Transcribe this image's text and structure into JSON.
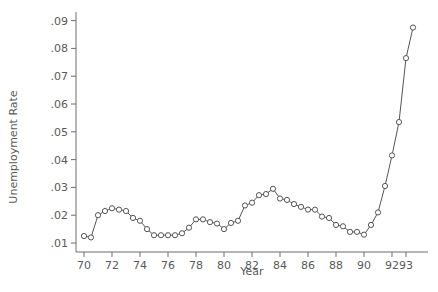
{
  "chart_data": {
    "type": "line",
    "title": "",
    "xlabel": "Year",
    "ylabel": "Unemployment Rate",
    "xlim": [
      69.2,
      94.5
    ],
    "ylim": [
      0.0,
      0.093
    ],
    "grid": false,
    "legend": null,
    "x_ticks": [
      70,
      72,
      74,
      76,
      78,
      80,
      82,
      84,
      86,
      88,
      90,
      92,
      93
    ],
    "x_tick_labels": [
      "70",
      "72",
      "74",
      "76",
      "78",
      "80",
      "82",
      "84",
      "86",
      "88",
      "90",
      "92",
      "93"
    ],
    "y_ticks": [
      0.01,
      0.02,
      0.03,
      0.04,
      0.05,
      0.06,
      0.07,
      0.08,
      0.09
    ],
    "y_tick_labels": [
      ".01",
      ".02",
      ".03",
      ".04",
      ".05",
      ".06",
      ".07",
      ".08",
      ".09"
    ],
    "marker": "open-circle",
    "series": [
      {
        "name": "Unemployment Rate",
        "x": [
          70.0,
          70.5,
          71.0,
          71.5,
          72.0,
          72.5,
          73.0,
          73.5,
          74.0,
          74.5,
          75.0,
          75.5,
          76.0,
          76.5,
          77.0,
          77.5,
          78.0,
          78.5,
          79.0,
          79.5,
          80.0,
          80.5,
          81.0,
          81.5,
          82.0,
          82.5,
          83.0,
          83.5,
          84.0,
          84.5,
          85.0,
          85.5,
          86.0,
          86.5,
          87.0,
          87.5,
          88.0,
          88.5,
          89.0,
          89.5,
          90.0,
          90.5,
          91.0,
          91.5,
          92.0,
          92.5,
          93.0,
          93.5
        ],
        "values": [
          0.0125,
          0.012,
          0.02,
          0.0215,
          0.0225,
          0.022,
          0.0215,
          0.019,
          0.018,
          0.015,
          0.0128,
          0.0128,
          0.0128,
          0.0128,
          0.0135,
          0.0155,
          0.0185,
          0.0185,
          0.0175,
          0.017,
          0.015,
          0.0172,
          0.018,
          0.0235,
          0.0245,
          0.0272,
          0.0276,
          0.0295,
          0.026,
          0.0255,
          0.024,
          0.023,
          0.022,
          0.022,
          0.0195,
          0.019,
          0.0165,
          0.016,
          0.014,
          0.014,
          0.013,
          0.0165,
          0.021,
          0.0305,
          0.0415,
          0.0535,
          0.0765,
          0.0875
        ]
      }
    ]
  },
  "axes": {
    "x_title": "Year",
    "y_title": "Unemployment Rate"
  }
}
